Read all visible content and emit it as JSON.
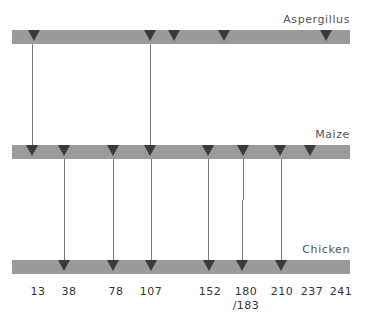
{
  "tracks": [
    {
      "name": "Aspergillus",
      "label_top": 13,
      "bar_top": 30,
      "markers": [
        34,
        150,
        174,
        224,
        326
      ]
    },
    {
      "name": "Maize",
      "label_top": 128,
      "bar_top": 145,
      "markers": [
        32,
        64,
        113,
        150,
        208,
        243,
        280,
        310
      ]
    },
    {
      "name": "Chicken",
      "label_top": 243,
      "bar_top": 260,
      "markers": [
        64,
        113,
        151,
        209,
        242,
        281
      ]
    }
  ],
  "connectors": [
    {
      "x": 32,
      "from": 44,
      "to": 145
    },
    {
      "x": 150,
      "from": 44,
      "to": 145
    },
    {
      "x": 64,
      "from": 159,
      "to": 260
    },
    {
      "x": 113,
      "from": 159,
      "to": 260
    },
    {
      "x": 151,
      "from": 159,
      "to": 260
    },
    {
      "x": 208,
      "from": 159,
      "to": 260
    },
    {
      "x": 243,
      "from": 159,
      "to": 200
    },
    {
      "x": 242,
      "from": 200,
      "to": 260
    },
    {
      "x": 281,
      "from": 159,
      "to": 260
    }
  ],
  "positions": [
    {
      "label": "13",
      "x": 38
    },
    {
      "label": "38",
      "x": 69
    },
    {
      "label": "78",
      "x": 116
    },
    {
      "label": "107",
      "x": 151
    },
    {
      "label": "152",
      "x": 210
    },
    {
      "label": "180\n/183",
      "x": 246
    },
    {
      "label": "210",
      "x": 282
    },
    {
      "label": "237",
      "x": 312
    },
    {
      "label": "241",
      "x": 341
    }
  ],
  "colors": {
    "bar": "#9a9a9a",
    "marker": "#3a3a3a",
    "line": "#777777"
  }
}
